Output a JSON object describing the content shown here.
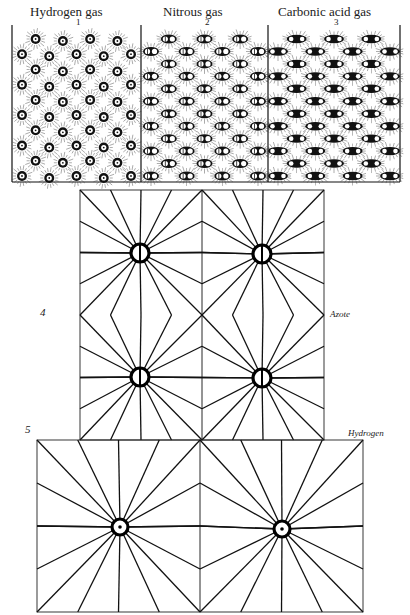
{
  "plate_corner_text": "PLATE 4",
  "panels": [
    {
      "title": "Hydrogen gas",
      "number": "1",
      "kind": "single",
      "x0": 12,
      "x1": 141
    },
    {
      "title": "Nitrous gas",
      "number": "2",
      "kind": "double",
      "x0": 141,
      "x1": 268
    },
    {
      "title": "Carbonic acid gas",
      "number": "3",
      "kind": "triple",
      "x0": 268,
      "x1": 400
    }
  ],
  "panel_box": {
    "top": 25,
    "bottom": 182
  },
  "figure4": {
    "number": "4",
    "label": "Azote",
    "box": {
      "x0": 80,
      "y0": 190,
      "x1": 324,
      "y1": 440
    },
    "atoms": [
      [
        140,
        253
      ],
      [
        262,
        254
      ],
      [
        140,
        377
      ],
      [
        262,
        378
      ]
    ],
    "atom_symbol": "ring-with-vertical-bar"
  },
  "figure5": {
    "number": "5",
    "label": "Hydrogen",
    "box": {
      "x0": 37,
      "y0": 440,
      "x1": 363,
      "y1": 612
    },
    "atoms": [
      [
        120,
        527
      ],
      [
        282,
        529
      ]
    ],
    "atom_symbol": "ring-with-center-dot"
  }
}
